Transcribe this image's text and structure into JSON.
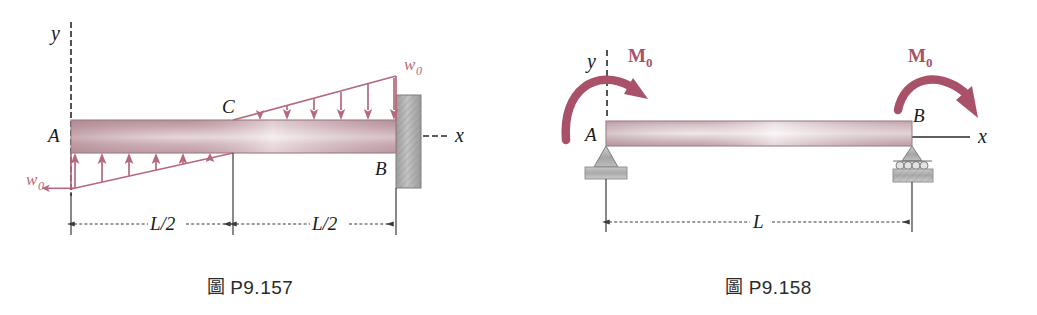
{
  "page": {
    "background": "#ffffff",
    "width": 1037,
    "height": 315
  },
  "colors": {
    "load_pink": "#b5697d",
    "moment_pink": "#a85168",
    "beam_dark": "#b89099",
    "beam_light": "#f0e6e8",
    "support_gray": "#9a9a9a",
    "wall_gray": "#a8a8a8",
    "ink": "#1a1a1a",
    "dim_line": "#3a3a3a"
  },
  "figures": [
    {
      "id": "fig-p9-157",
      "caption_mark": "圖",
      "caption_text": "P9.157",
      "beam": {
        "type": "cantilever",
        "left_end_label": "A",
        "right_end_label": "B",
        "midpoint_label": "C",
        "support_right": "fixed-wall"
      },
      "axes": {
        "y_label": "y",
        "x_label": "x"
      },
      "loads": [
        {
          "name": "triangular-load-upward-left",
          "label": "w",
          "subscript": "0",
          "direction": "up",
          "peak_at": "A",
          "zero_at": "C",
          "arrow_count": 6
        },
        {
          "name": "triangular-load-downward-right",
          "label": "w",
          "subscript": "0",
          "direction": "down",
          "peak_at": "B",
          "zero_at": "C",
          "arrow_count": 6
        }
      ],
      "dimensions": [
        {
          "name": "span-left",
          "label": "L/2"
        },
        {
          "name": "span-right",
          "label": "L/2"
        }
      ]
    },
    {
      "id": "fig-p9-158",
      "caption_mark": "圖",
      "caption_text": "P9.158",
      "beam": {
        "type": "simply-supported",
        "left_end_label": "A",
        "right_end_label": "B",
        "support_left": "pin",
        "support_right": "roller"
      },
      "axes": {
        "y_label": "y",
        "x_label": "x"
      },
      "moments": [
        {
          "name": "applied-moment-left",
          "label": "M",
          "subscript": "0",
          "sense": "clockwise",
          "at": "A"
        },
        {
          "name": "applied-moment-right",
          "label": "M",
          "subscript": "0",
          "sense": "clockwise",
          "at": "B"
        }
      ],
      "dimensions": [
        {
          "name": "span-total",
          "label": "L"
        }
      ]
    }
  ]
}
